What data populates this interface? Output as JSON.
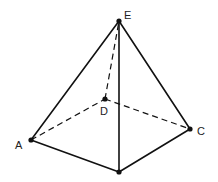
{
  "diagram": {
    "vertices": {
      "E": {
        "x": 119,
        "y": 21,
        "label": "E",
        "lx": 124,
        "ly": 19
      },
      "A": {
        "x": 31,
        "y": 140,
        "label": "A",
        "lx": 15,
        "ly": 149
      },
      "D": {
        "x": 105,
        "y": 99,
        "label": "D",
        "lx": 100,
        "ly": 115
      },
      "C": {
        "x": 190,
        "y": 129,
        "label": "C",
        "lx": 197,
        "ly": 135
      },
      "B": {
        "x": 119,
        "y": 172,
        "label": ""
      }
    },
    "edges": [
      {
        "from": "E",
        "to": "A",
        "style": "solid"
      },
      {
        "from": "E",
        "to": "C",
        "style": "solid"
      },
      {
        "from": "E",
        "to": "B",
        "style": "solid"
      },
      {
        "from": "A",
        "to": "B",
        "style": "solid"
      },
      {
        "from": "B",
        "to": "C",
        "style": "solid"
      },
      {
        "from": "A",
        "to": "D",
        "style": "dashed"
      },
      {
        "from": "D",
        "to": "C",
        "style": "dashed"
      },
      {
        "from": "D",
        "to": "E",
        "style": "dashed"
      }
    ],
    "line_color": "#111111",
    "background": "#ffffff"
  }
}
